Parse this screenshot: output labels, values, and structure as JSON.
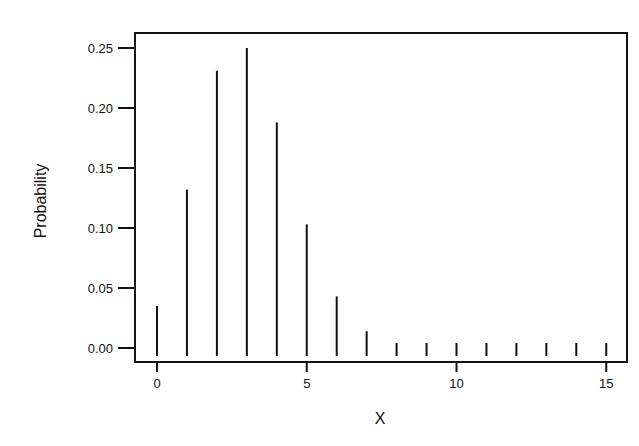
{
  "chart_data": {
    "type": "bar",
    "subtype": "stem",
    "title": "",
    "xlabel": "X",
    "ylabel": "Probability",
    "x": [
      0,
      1,
      2,
      3,
      4,
      5,
      6,
      7,
      8,
      9,
      10,
      11,
      12,
      13,
      14,
      15
    ],
    "values": [
      0.035,
      0.132,
      0.231,
      0.25,
      0.188,
      0.103,
      0.043,
      0.014,
      0.004,
      0.004,
      0.004,
      0.004,
      0.004,
      0.004,
      0.004,
      0.004
    ],
    "xticks": [
      0,
      5,
      10,
      15
    ],
    "xtick_labels": [
      "0",
      "5",
      "10",
      "15"
    ],
    "yticks": [
      0.0,
      0.05,
      0.1,
      0.15,
      0.2,
      0.25
    ],
    "ytick_labels": [
      "0.00",
      "0.05",
      "0.10",
      "0.15",
      "0.20",
      "0.25"
    ],
    "xlim": [
      -0.7,
      15.7
    ],
    "ylim": [
      -0.012,
      0.262
    ],
    "grid": false,
    "legend": null,
    "bar_color": "#111111"
  }
}
